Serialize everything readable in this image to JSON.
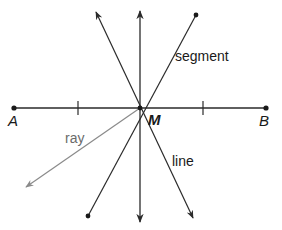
{
  "diagram": {
    "center_point": "M",
    "endpoint_left": "A",
    "endpoint_right": "B",
    "labels": {
      "segment": "segment",
      "ray": "ray",
      "line": "line"
    },
    "colors": {
      "stroke": "#2a2a2a",
      "ray": "#8a8a8a",
      "background": "#ffffff"
    }
  }
}
